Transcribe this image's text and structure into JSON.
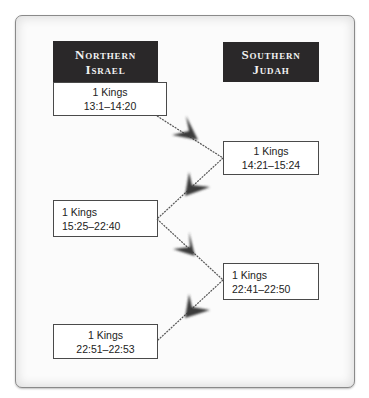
{
  "diagram": {
    "columns": [
      {
        "label_line1": "Northern",
        "label_line2": "Israel"
      },
      {
        "label_line1": "Southern",
        "label_line2": "Judah"
      }
    ],
    "boxes": [
      {
        "book": "1 Kings",
        "range": "13:1–14:20",
        "column": "Northern Israel"
      },
      {
        "book": "1 Kings",
        "range": "14:21–15:24",
        "column": "Southern Judah"
      },
      {
        "book": "1 Kings",
        "range": "15:25–22:40",
        "column": "Northern Israel"
      },
      {
        "book": "1 Kings",
        "range": "22:41–22:50",
        "column": "Southern Judah"
      },
      {
        "book": "1 Kings",
        "range": "22:51–22:53",
        "column": "Northern Israel"
      }
    ],
    "arrow_color": "#3a3a3a",
    "header_color": "#2a2829"
  }
}
